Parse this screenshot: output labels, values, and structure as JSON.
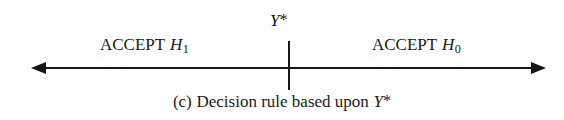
{
  "figure": {
    "caption_prefix": "(c)",
    "caption_text": "Decision rule based upon",
    "caption_variable": "Y",
    "caption_variable_mark": "*"
  },
  "axis": {
    "left_arrow_icon": "arrow-left-icon",
    "right_arrow_icon": "arrow-right-icon",
    "line_color": "#151515"
  },
  "threshold": {
    "tick_label_variable": "Y",
    "tick_label_mark": "*",
    "tick_color": "#151515"
  },
  "regions": {
    "left": {
      "decision": "ACCEPT",
      "hypothesis": "H",
      "hypothesis_subscript": "1"
    },
    "right": {
      "decision": "ACCEPT",
      "hypothesis": "H",
      "hypothesis_subscript": "0"
    }
  }
}
